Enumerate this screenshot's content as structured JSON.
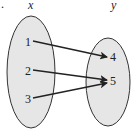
{
  "diagram": {
    "type": "mapping",
    "marker": ".",
    "domain": {
      "header": "x",
      "values": [
        "1",
        "2",
        "3"
      ]
    },
    "range": {
      "header": "y",
      "values": [
        "4",
        "5"
      ]
    },
    "mappings": [
      {
        "from": "1",
        "to": "4"
      },
      {
        "from": "2",
        "to": "5"
      },
      {
        "from": "3",
        "to": "5"
      }
    ],
    "colors": {
      "oval_fill": "#e6e6e6",
      "stroke": "#222222"
    }
  }
}
